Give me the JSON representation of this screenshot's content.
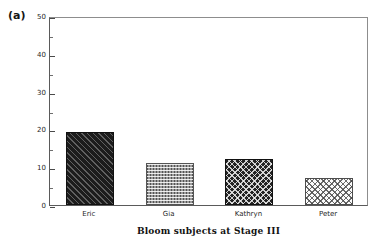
{
  "panel": {
    "label": "(a)"
  },
  "chart_data": {
    "type": "bar",
    "title": "",
    "xlabel": "Bloom subjects at Stage III",
    "ylabel": "",
    "categories": [
      "Eric",
      "Gia",
      "Kathryn",
      "Peter"
    ],
    "values": [
      19.2,
      11.1,
      12.2,
      7.2
    ],
    "ylim": [
      0,
      50
    ],
    "y_major_ticks": [
      0,
      10,
      20,
      30,
      40,
      50
    ],
    "y_tick_labels": [
      "0",
      "10",
      "20",
      "30",
      "40",
      "50"
    ],
    "y_minor_ticks": [
      5,
      15,
      25,
      35,
      45
    ],
    "grid": false,
    "legend": null,
    "bar_patterns": [
      "diagonal-hatch-dark",
      "dotted-gray",
      "crosshatch-dark",
      "crosshatch-light"
    ],
    "colors": {
      "bar_eric": "#1c1c1c",
      "bar_gia": "#9c9c9c",
      "bar_kathryn": "#232323",
      "bar_peter": "#fbfbfb",
      "axis": "#5a5a5a",
      "frame": "#8d8d8d",
      "text": "#1f1f1f",
      "background": "#ffffff"
    }
  }
}
